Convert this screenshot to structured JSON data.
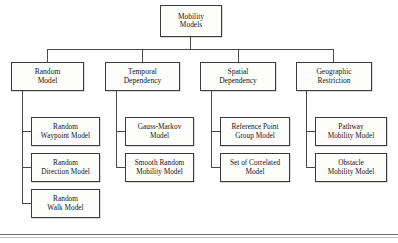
{
  "diagram": {
    "type": "hierarchy-tree",
    "root": {
      "id": "mobility-models",
      "lines": [
        "Mobility",
        "Models"
      ]
    },
    "categories": [
      {
        "id": "random-model",
        "lines": [
          "Random",
          "Model"
        ],
        "children": [
          {
            "id": "random-waypoint-model",
            "lines": [
              "Random",
              "Waypoint Model"
            ]
          },
          {
            "id": "random-direction-model",
            "lines": [
              "Random",
              "Direction Model"
            ]
          },
          {
            "id": "random-walk-model",
            "lines": [
              "Random",
              "Walk Model"
            ]
          }
        ]
      },
      {
        "id": "temporal-dependency",
        "lines": [
          "Temporal",
          "Dependency"
        ],
        "children": [
          {
            "id": "gauss-markov-model",
            "lines": [
              "Gauss-Markov",
              "Model"
            ]
          },
          {
            "id": "smooth-random-mobility-model",
            "lines": [
              "Smooth Random",
              "Mobility Model"
            ]
          }
        ]
      },
      {
        "id": "spatial-dependency",
        "lines": [
          "Spatial",
          "Dependency"
        ],
        "children": [
          {
            "id": "reference-point-group-model",
            "lines": [
              "Reference Point",
              "Group Model"
            ]
          },
          {
            "id": "set-of-correlated-model",
            "lines": [
              "Set of Correlated",
              "Model"
            ]
          }
        ]
      },
      {
        "id": "geographic-restriction",
        "lines": [
          "Geographic",
          "Restriction"
        ],
        "children": [
          {
            "id": "pathway-mobility-model",
            "lines": [
              "Pathway",
              "Mobility Model"
            ]
          },
          {
            "id": "obstacle-mobility-model",
            "lines": [
              "Obstacle",
              "Mobility Model"
            ]
          }
        ]
      }
    ],
    "colors": {
      "box_border": "#3b3b3b",
      "box_fill": "#fdfdfc",
      "connector": "#4a4a4a",
      "text": "#141414",
      "rule": "#6f6f6f",
      "page_background": "#ffffff"
    }
  }
}
